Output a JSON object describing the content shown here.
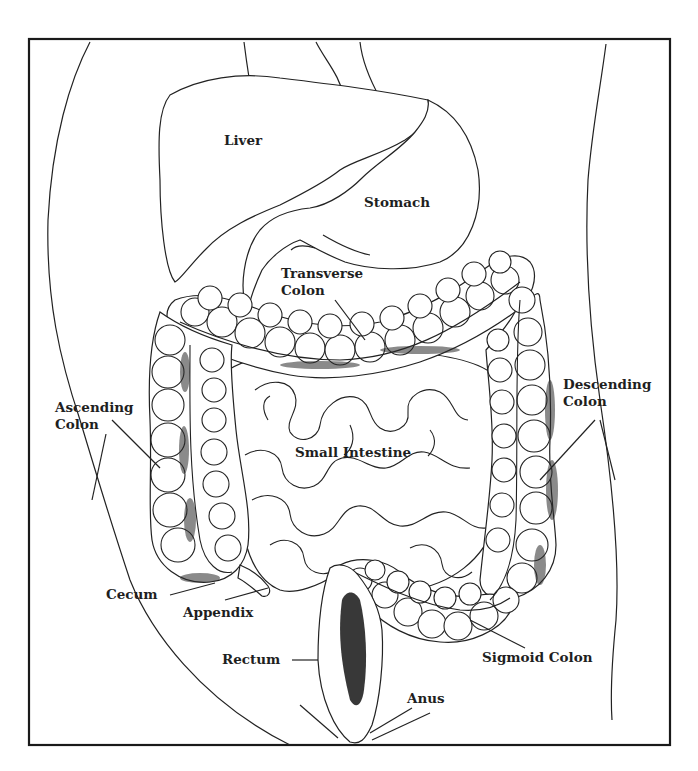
{
  "diagram": {
    "type": "anatomical-illustration",
    "labels": {
      "liver": "Liver",
      "stomach": "Stomach",
      "transverse_colon_1": "Transverse",
      "transverse_colon_2": "Colon",
      "ascending_colon_1": "Ascending",
      "ascending_colon_2": "Colon",
      "descending_colon_1": "Descending",
      "descending_colon_2": "Colon",
      "small_intestine": "Small Intestine",
      "cecum": "Cecum",
      "appendix": "Appendix",
      "rectum": "Rectum",
      "sigmoid_colon": "Sigmoid Colon",
      "anus": "Anus"
    },
    "colors": {
      "line": "#222222",
      "background": "#ffffff",
      "text": "#1f1f1f"
    }
  }
}
